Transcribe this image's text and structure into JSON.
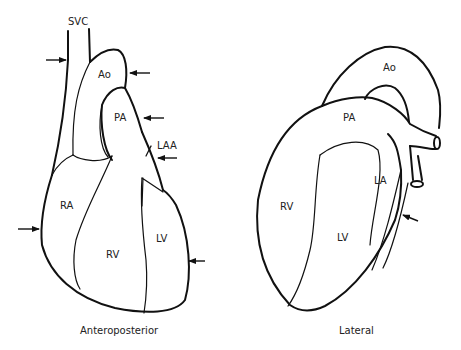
{
  "figure": {
    "views": [
      {
        "id": "anteroposterior",
        "caption": "Anteroposterior",
        "labels": {
          "svc": "SVC",
          "ao": "Ao",
          "pa": "PA",
          "laa": "LAA",
          "ra": "RA",
          "rv": "RV",
          "lv": "LV"
        },
        "arrow_count": 6
      },
      {
        "id": "lateral",
        "caption": "Lateral",
        "labels": {
          "ao": "Ao",
          "pa": "PA",
          "la": "LA",
          "rv": "RV",
          "lv": "LV"
        },
        "arrow_count": 1
      }
    ],
    "colors": {
      "stroke": "#111111",
      "text": "#222222",
      "background": "#ffffff"
    }
  }
}
